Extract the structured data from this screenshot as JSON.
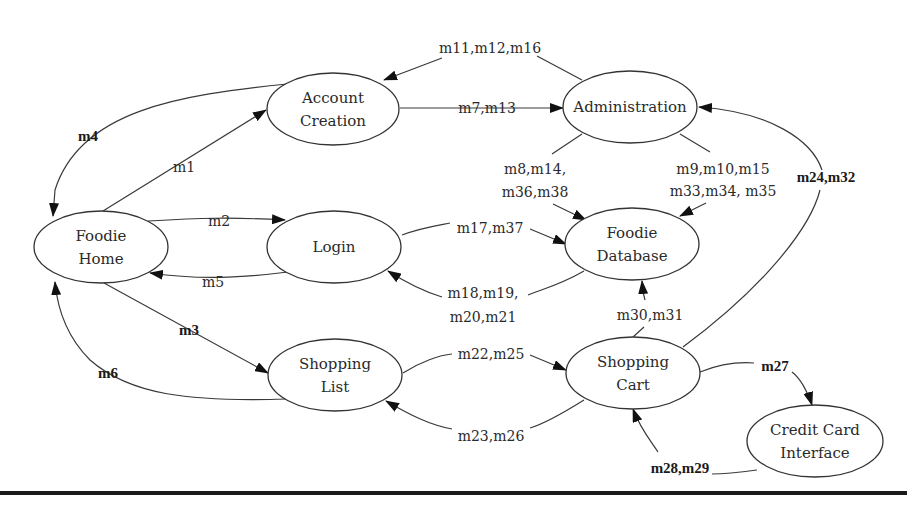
{
  "diagram": {
    "nodes": [
      {
        "id": "account_creation",
        "lines": [
          "Account",
          "Creation"
        ]
      },
      {
        "id": "administration",
        "lines": [
          "Administration"
        ]
      },
      {
        "id": "foodie_home",
        "lines": [
          "Foodie",
          "Home"
        ]
      },
      {
        "id": "login",
        "lines": [
          "Login"
        ]
      },
      {
        "id": "foodie_database",
        "lines": [
          "Foodie",
          "Database"
        ]
      },
      {
        "id": "shopping_list",
        "lines": [
          "Shopping",
          "List"
        ]
      },
      {
        "id": "shopping_cart",
        "lines": [
          "Shopping",
          "Cart"
        ]
      },
      {
        "id": "credit_card_interface",
        "lines": [
          "Credit Card",
          "Interface"
        ]
      }
    ],
    "edges": [
      {
        "id": "e_m1",
        "from": "foodie_home",
        "to": "account_creation",
        "label": [
          "m1"
        ]
      },
      {
        "id": "e_m2",
        "from": "foodie_home",
        "to": "login",
        "label": [
          "m2"
        ]
      },
      {
        "id": "e_m3",
        "from": "foodie_home",
        "to": "shopping_list",
        "label": [
          "m3"
        ]
      },
      {
        "id": "e_m4",
        "from": "account_creation",
        "to": "foodie_home",
        "label": [
          "m4"
        ]
      },
      {
        "id": "e_m5",
        "from": "login",
        "to": "foodie_home",
        "label": [
          "m5"
        ]
      },
      {
        "id": "e_m6",
        "from": "shopping_list",
        "to": "foodie_home",
        "label": [
          "m6"
        ]
      },
      {
        "id": "e_m7",
        "from": "account_creation",
        "to": "administration",
        "label": [
          "m7,m13"
        ]
      },
      {
        "id": "e_m11",
        "from": "administration",
        "to": "account_creation",
        "label": [
          "m11,m12,m16"
        ]
      },
      {
        "id": "e_m8",
        "from": "administration",
        "to": "foodie_database",
        "label": [
          "m8,m14,",
          "m36,m38"
        ]
      },
      {
        "id": "e_m9",
        "from": "foodie_database",
        "to": "administration",
        "label": [
          "m9,m10,m15",
          "m33,m34, m35"
        ]
      },
      {
        "id": "e_m17",
        "from": "login",
        "to": "foodie_database",
        "label": [
          "m17,m37"
        ]
      },
      {
        "id": "e_m18",
        "from": "foodie_database",
        "to": "login",
        "label": [
          "m18,m19,",
          "m20,m21"
        ]
      },
      {
        "id": "e_m22",
        "from": "shopping_list",
        "to": "shopping_cart",
        "label": [
          "m22,m25"
        ]
      },
      {
        "id": "e_m23",
        "from": "shopping_cart",
        "to": "shopping_list",
        "label": [
          "m23,m26"
        ]
      },
      {
        "id": "e_m30",
        "from": "shopping_cart",
        "to": "foodie_database",
        "label": [
          "m30,m31"
        ]
      },
      {
        "id": "e_m24",
        "from": "shopping_cart",
        "to": "administration",
        "label": [
          "m24,m32"
        ]
      },
      {
        "id": "e_m27",
        "from": "shopping_cart",
        "to": "credit_card_interface",
        "label": [
          "m27"
        ]
      },
      {
        "id": "e_m28",
        "from": "credit_card_interface",
        "to": "shopping_cart",
        "label": [
          "m28,m29"
        ]
      }
    ]
  }
}
